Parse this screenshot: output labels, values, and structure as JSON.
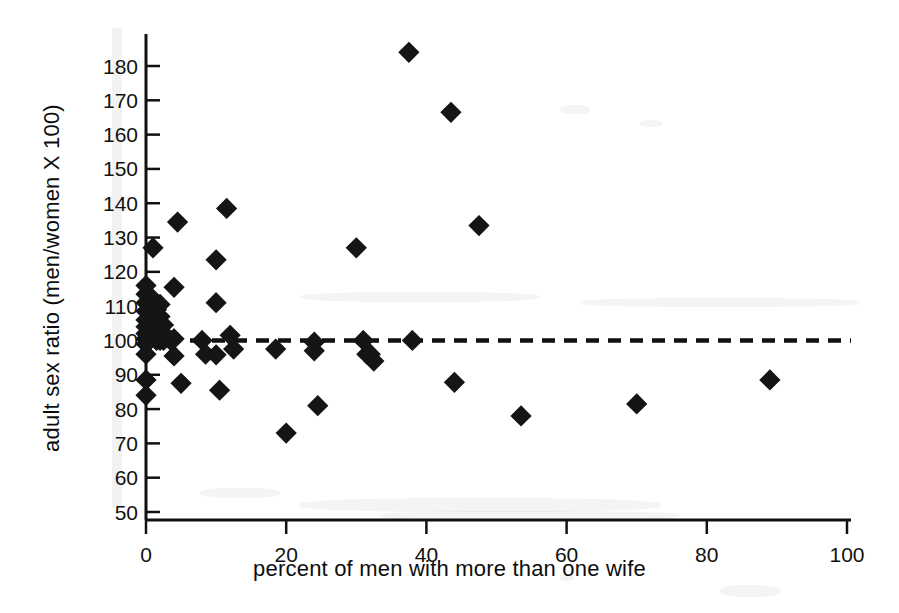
{
  "figure": {
    "background_color": "#ffffff",
    "ink_color": "#111111",
    "marker_color": "#151515",
    "marker_shape": "diamond",
    "width": 899,
    "height": 613
  },
  "chart_data": {
    "type": "scatter",
    "title": "",
    "subtitle": "",
    "xlabel": "percent of men with more than one wife",
    "ylabel": "adult sex ratio (men/women X 100)",
    "xlim": [
      0,
      100
    ],
    "ylim": [
      50,
      186
    ],
    "xticks": [
      0,
      20,
      40,
      60,
      80,
      100
    ],
    "yticks": [
      50,
      60,
      70,
      80,
      90,
      100,
      110,
      120,
      130,
      140,
      150,
      160,
      170,
      180
    ],
    "xtick_labels": [
      "0",
      "20",
      "40",
      "60",
      "80",
      "100"
    ],
    "ytick_labels": [
      "50",
      "60",
      "70",
      "80",
      "90",
      "100",
      "110",
      "120",
      "130",
      "140",
      "150",
      "160",
      "170",
      "180"
    ],
    "grid": false,
    "legend": null,
    "legend_position": "none",
    "annotations": [
      {
        "name": "parity-reference-line",
        "type": "horizontal-dashed-line",
        "y": 100,
        "style": "dashed",
        "label": ""
      }
    ],
    "series": [
      {
        "name": "societies",
        "marker": "diamond",
        "color": "#151515",
        "points": [
          [
            0.0,
            116.0
          ],
          [
            0.0,
            113.5
          ],
          [
            0.0,
            111.0
          ],
          [
            0.0,
            108.5
          ],
          [
            0.0,
            106.0
          ],
          [
            0.0,
            104.0
          ],
          [
            0.0,
            102.0
          ],
          [
            0.0,
            100.5
          ],
          [
            0.0,
            99.0
          ],
          [
            0.0,
            96.0
          ],
          [
            0.0,
            88.5
          ],
          [
            0.0,
            84.0
          ],
          [
            1.0,
            127.0
          ],
          [
            1.0,
            112.0
          ],
          [
            1.5,
            109.0
          ],
          [
            1.5,
            105.5
          ],
          [
            1.5,
            103.0
          ],
          [
            1.5,
            100.0
          ],
          [
            2.0,
            110.5
          ],
          [
            2.0,
            107.0
          ],
          [
            2.0,
            100.0
          ],
          [
            2.5,
            104.5
          ],
          [
            2.5,
            100.0
          ],
          [
            3.0,
            101.0
          ],
          [
            3.5,
            100.0
          ],
          [
            4.0,
            115.5
          ],
          [
            4.0,
            100.5
          ],
          [
            4.0,
            95.5
          ],
          [
            4.5,
            134.5
          ],
          [
            5.0,
            87.5
          ],
          [
            8.0,
            100.0
          ],
          [
            8.5,
            96.0
          ],
          [
            10.0,
            123.5
          ],
          [
            10.0,
            111.0
          ],
          [
            10.0,
            95.8
          ],
          [
            10.5,
            85.5
          ],
          [
            11.5,
            138.5
          ],
          [
            12.0,
            101.5
          ],
          [
            12.5,
            97.5
          ],
          [
            18.5,
            97.5
          ],
          [
            20.0,
            73.0
          ],
          [
            24.0,
            99.5
          ],
          [
            24.0,
            97.0
          ],
          [
            24.5,
            81.0
          ],
          [
            30.0,
            127.0
          ],
          [
            31.0,
            100.0
          ],
          [
            31.5,
            96.0
          ],
          [
            32.5,
            94.0
          ],
          [
            32.0,
            96.0
          ],
          [
            37.5,
            184.0
          ],
          [
            38.0,
            100.0
          ],
          [
            43.5,
            166.5
          ],
          [
            44.0,
            87.8
          ],
          [
            47.5,
            133.5
          ],
          [
            53.5,
            78.0
          ],
          [
            70.0,
            81.5
          ],
          [
            89.0,
            88.5
          ]
        ]
      }
    ]
  }
}
